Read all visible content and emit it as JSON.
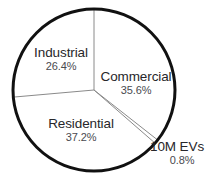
{
  "chart_data": {
    "type": "pie",
    "title": "",
    "subtitle": "",
    "xlabel": "",
    "ylabel": "",
    "legend_position": "none",
    "grid": false,
    "start_angle_deg": 0,
    "direction": "clockwise",
    "labels": [
      "Commercial",
      "10M EVs",
      "Residential",
      "Industrial"
    ],
    "values": [
      35.6,
      0.8,
      37.2,
      26.4
    ],
    "unit": "%",
    "slices": [
      {
        "name": "Commercial",
        "value": 35.6,
        "value_label": "35.6%",
        "label_position": "inside",
        "start_deg": 0,
        "end_deg": 128.16
      },
      {
        "name": "10M EVs",
        "value": 0.8,
        "value_label": "0.8%",
        "label_position": "outside",
        "start_deg": 128.16,
        "end_deg": 131.04
      },
      {
        "name": "Residential",
        "value": 37.2,
        "value_label": "37.2%",
        "label_position": "inside",
        "start_deg": 131.04,
        "end_deg": 264.96
      },
      {
        "name": "Industrial",
        "value": 26.4,
        "value_label": "26.4%",
        "label_position": "inside",
        "start_deg": 264.96,
        "end_deg": 360
      }
    ],
    "colors": {
      "slice_fill": "#ffffff",
      "outline": "#111111",
      "divider": "#8a8a8a",
      "label_text": "#27272a",
      "percent_text": "#4a4a4f",
      "background": "#ffffff"
    }
  },
  "labels": {
    "industrial": {
      "name": "Industrial",
      "percent": "26.4%"
    },
    "commercial": {
      "name": "Commercial",
      "percent": "35.6%"
    },
    "residential": {
      "name": "Residential",
      "percent": "37.2%"
    },
    "evs": {
      "name": "10M EVs",
      "percent": "0.8%"
    }
  }
}
